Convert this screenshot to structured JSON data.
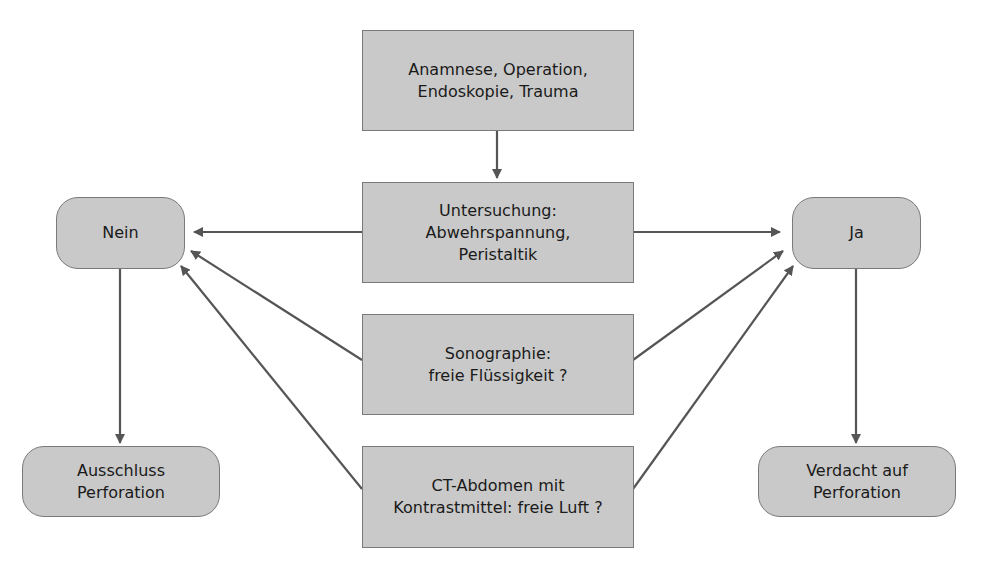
{
  "diagram": {
    "colors": {
      "node_fill": "#c9c9c9",
      "node_border": "#7a7a7a",
      "arrow": "#555555",
      "text": "#1a1a1a"
    },
    "nodes": {
      "anamnese": {
        "lines": [
          "Anamnese, Operation,",
          "Endoskopie, Trauma"
        ]
      },
      "untersuchung": {
        "lines": [
          "Untersuchung:",
          "Abwehrspannung,",
          "Peristaltik"
        ]
      },
      "sonographie": {
        "lines": [
          "Sonographie:",
          "freie Flüssigkeit ?"
        ]
      },
      "ct": {
        "lines": [
          "CT-Abdomen mit",
          "Kontrastmittel: freie Luft ?"
        ]
      },
      "nein": {
        "lines": [
          "Nein"
        ]
      },
      "ja": {
        "lines": [
          "Ja"
        ]
      },
      "ausschluss": {
        "lines": [
          "Ausschluss",
          "Perforation"
        ]
      },
      "verdacht": {
        "lines": [
          "Verdacht auf",
          "Perforation"
        ]
      }
    },
    "edges": [
      {
        "from": "anamnese",
        "to": "untersuchung"
      },
      {
        "from": "untersuchung",
        "to": "nein"
      },
      {
        "from": "untersuchung",
        "to": "ja"
      },
      {
        "from": "sonographie",
        "to": "nein"
      },
      {
        "from": "sonographie",
        "to": "ja"
      },
      {
        "from": "ct",
        "to": "nein"
      },
      {
        "from": "ct",
        "to": "ja"
      },
      {
        "from": "nein",
        "to": "ausschluss"
      },
      {
        "from": "ja",
        "to": "verdacht"
      }
    ]
  }
}
